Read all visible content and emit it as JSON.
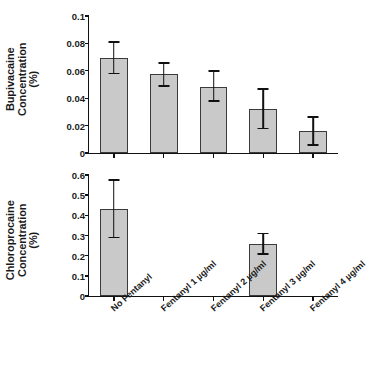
{
  "chart_data": [
    {
      "type": "bar",
      "panel": "top",
      "title": "",
      "ylabel": "Bupivacaine\nConcentration\n(%)",
      "xlabel": "",
      "categories": [
        "No Fentanyl",
        "Fentanyl 1 µg/ml",
        "Fentanyl 2 µg/ml",
        "Fentanyl 3 µg/ml",
        "Fentanyl 4 µg/ml"
      ],
      "values": [
        0.069,
        0.0575,
        0.0485,
        0.032,
        0.016
      ],
      "err_low": [
        0.058,
        0.049,
        0.038,
        0.018,
        0.006
      ],
      "err_high": [
        0.081,
        0.0655,
        0.06,
        0.0465,
        0.0265
      ],
      "ylim": [
        0,
        0.1
      ],
      "yticks": [
        0,
        0.02,
        0.04,
        0.06,
        0.08,
        0.1
      ],
      "ytick_labels": [
        "0",
        "0.02",
        "0.04",
        "0.06",
        "0.08",
        "0.1"
      ],
      "grid": false,
      "legend": "none"
    },
    {
      "type": "bar",
      "panel": "bottom",
      "title": "",
      "ylabel": "Chloroprocaine\nConcentration\n(%)",
      "xlabel": "",
      "categories": [
        "No Fentanyl",
        "Fentanyl 1 µg/ml",
        "Fentanyl 2 µg/ml",
        "Fentanyl 3 µg/ml",
        "Fentanyl 4 µg/ml"
      ],
      "values": [
        0.43,
        0,
        0,
        0.26,
        0
      ],
      "err_low": [
        0.29,
        null,
        null,
        0.21,
        null
      ],
      "err_high": [
        0.575,
        null,
        null,
        0.31,
        null
      ],
      "ylim": [
        0,
        0.6
      ],
      "yticks": [
        0,
        0.1,
        0.2,
        0.3,
        0.4,
        0.5,
        0.6
      ],
      "ytick_labels": [
        "0",
        "0.1",
        "0.2",
        "0.3",
        "0.4",
        "0.5",
        "0.6"
      ],
      "grid": false,
      "legend": "none"
    }
  ],
  "style": {
    "bar_fill": "#c9c9c9",
    "bar_border": "#3a3a3a",
    "axis_color": "#111111",
    "background": "#ffffff"
  }
}
